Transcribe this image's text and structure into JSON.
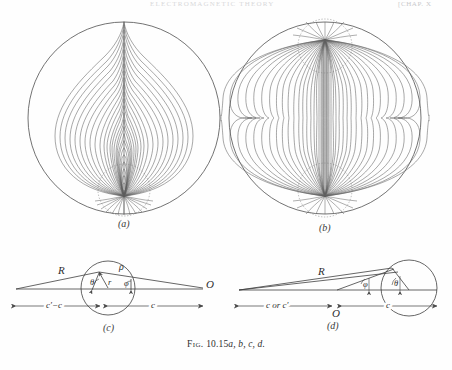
{
  "page": {
    "width": 452,
    "height": 370,
    "background": "#fefefe",
    "ink": "#555555",
    "header_center": "ELECTROMAGNETIC THEORY",
    "header_right": "[CHAP. X"
  },
  "caption": {
    "fig_word": "Fig.",
    "number": "10.15",
    "parts": "a, b, c, d."
  },
  "panels": [
    {
      "id": "a",
      "label": "(a)",
      "label_x": 118,
      "label_y": 218,
      "kind": "field-line-diagram",
      "description": "Large circle containing dipole-like field lines converging at a point near the bottom, with a vertical axis line through the center.",
      "circle": {
        "cx": 124,
        "cy": 118,
        "r": 96
      },
      "pole": {
        "x": 124,
        "y": 196
      },
      "inner_circle": {
        "cx": 124,
        "cy": 190,
        "r": 26
      },
      "loop_count": 26,
      "axis_line": {
        "x": 124,
        "y_top": 22,
        "y_bottom": 214
      }
    },
    {
      "id": "b",
      "label": "(b)",
      "label_x": 327,
      "label_y": 224,
      "kind": "field-line-diagram",
      "description": "Large circle with field lines running between two poles, one near the top and one near the bottom of the circle.",
      "circle": {
        "cx": 325,
        "cy": 118,
        "r": 96
      },
      "pole_top": {
        "x": 325,
        "y": 40
      },
      "pole_bottom": {
        "x": 325,
        "y": 196
      },
      "loop_count": 24
    },
    {
      "id": "c",
      "label": "(c)",
      "label_x": 110,
      "label_y": 327,
      "kind": "geometry-diagram",
      "description": "Thin triangle from far-left apex to point O on the right, passing a small circle; radii and angles marked inside the circle.",
      "circle": {
        "cx": 108,
        "cy": 288,
        "r": 27
      },
      "apex_left": {
        "x": 16,
        "y": 289
      },
      "point_O": {
        "x": 203,
        "y": 289
      },
      "labels": [
        {
          "text": "R",
          "x": 58,
          "y": 272,
          "italic": true
        },
        {
          "text": "ρ",
          "x": 120,
          "y": 268,
          "italic": true
        },
        {
          "text": "θ",
          "x": 94,
          "y": 283,
          "italic": true
        },
        {
          "text": "r",
          "x": 110,
          "y": 283,
          "italic": true
        },
        {
          "text": "φ",
          "x": 126,
          "y": 284,
          "italic": true
        },
        {
          "text": "O",
          "x": 207,
          "y": 286,
          "italic": true
        }
      ],
      "dimension_left_label": "c′−c",
      "dimension_right_label": "c",
      "dimension_y": 306
    },
    {
      "id": "d",
      "label": "(d)",
      "label_x": 334,
      "label_y": 327,
      "kind": "geometry-diagram",
      "description": "Thin triangle from far-left apex to a circle on the right; angles phi and theta marked, with O on the baseline.",
      "circle": {
        "cx": 409,
        "cy": 288,
        "r": 28
      },
      "apex_left": {
        "x": 239,
        "y": 290
      },
      "point_O": {
        "x": 337,
        "y": 290
      },
      "labels": [
        {
          "text": "R",
          "x": 321,
          "y": 273,
          "italic": true
        },
        {
          "text": "φ",
          "x": 367,
          "y": 285,
          "italic": true
        },
        {
          "text": "θ",
          "x": 397,
          "y": 284,
          "italic": true
        },
        {
          "text": "O",
          "x": 334,
          "y": 315,
          "italic": true
        }
      ],
      "dimension_left_label": "c or c′",
      "dimension_right_label": "c",
      "dimension_y": 306
    }
  ]
}
